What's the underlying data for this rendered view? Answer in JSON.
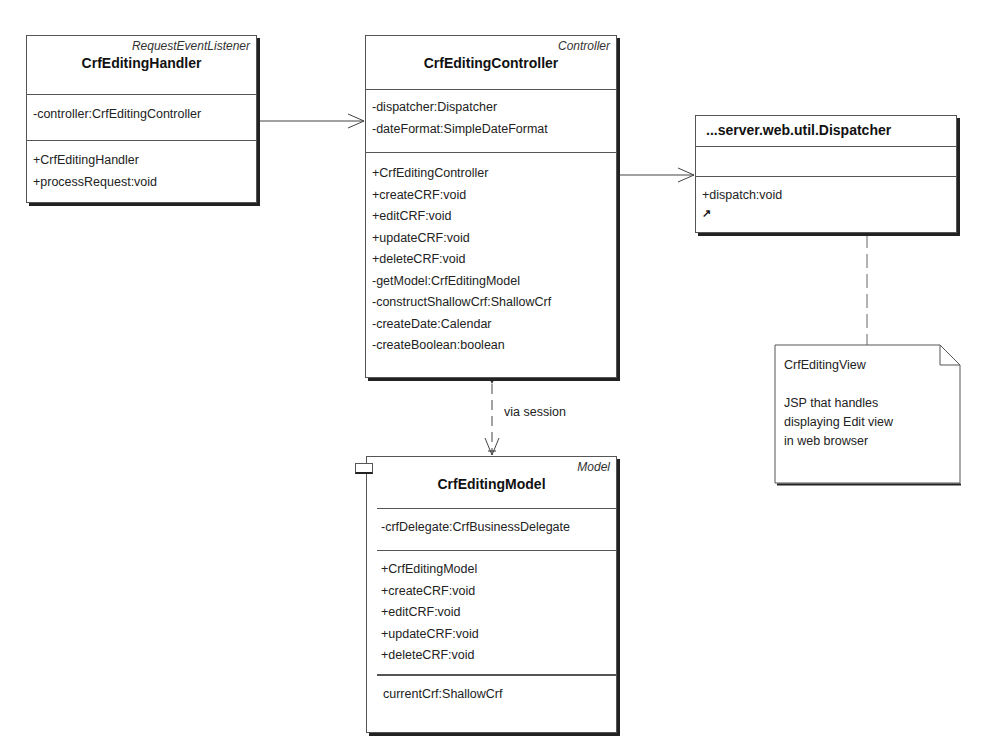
{
  "classes": {
    "handler": {
      "stereotype": "RequestEventListener",
      "name": "CrfEditingHandler",
      "attributes": [
        "-controller:CrfEditingController"
      ],
      "operations": [
        "+CrfEditingHandler",
        "+processRequest:void"
      ]
    },
    "controller": {
      "stereotype": "Controller",
      "name": "CrfEditingController",
      "attributes": [
        "-dispatcher:Dispatcher",
        "-dateFormat:SimpleDateFormat"
      ],
      "operations": [
        "+CrfEditingController",
        "+createCRF:void",
        "+editCRF:void",
        "+updateCRF:void",
        "+deleteCRF:void",
        "-getModel:CrfEditingModel",
        "-constructShallowCrf:ShallowCrf",
        "-createDate:Calendar",
        "-createBoolean:boolean"
      ]
    },
    "dispatcher": {
      "name": "...server.web.util.Dispatcher",
      "attributes": [],
      "operations": [
        "+dispatch:void"
      ],
      "link_icon": "shortcut-arrow-icon"
    },
    "model": {
      "stereotype": "Model",
      "name": "CrfEditingModel",
      "attributes": [
        "-crfDelegate:CrfBusinessDelegate"
      ],
      "operations": [
        "+CrfEditingModel",
        "+createCRF:void",
        "+editCRF:void",
        "+updateCRF:void",
        "+deleteCRF:void"
      ],
      "extra": [
        "currentCrf:ShallowCrf"
      ]
    }
  },
  "note": {
    "title": "CrfEditingView",
    "lines": [
      "JSP that handles",
      "displaying Edit view",
      "in web browser"
    ]
  },
  "relations": [
    {
      "from": "CrfEditingHandler",
      "to": "CrfEditingController",
      "type": "association",
      "label": ""
    },
    {
      "from": "CrfEditingController",
      "to": "...server.web.util.Dispatcher",
      "type": "association",
      "label": ""
    },
    {
      "from": "CrfEditingController",
      "to": "CrfEditingModel",
      "type": "dependency",
      "label": "via session"
    },
    {
      "from": "...server.web.util.Dispatcher",
      "to": "CrfEditingView",
      "type": "note-anchor",
      "label": ""
    }
  ]
}
